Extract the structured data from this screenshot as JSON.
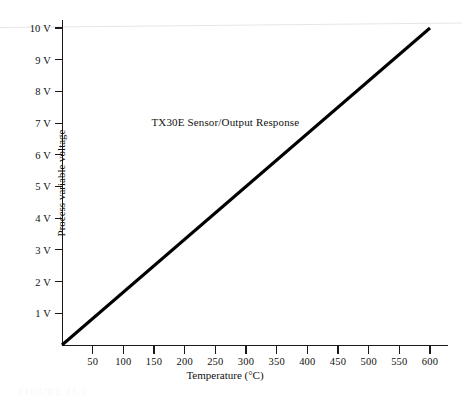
{
  "figure": {
    "annotation": "TX30E Sensor/Output Response",
    "caption_partial": "FIGURE 11-2"
  },
  "chart_data": {
    "type": "line",
    "title": "",
    "annotations": [
      {
        "text": "TX30E Sensor/Output Response",
        "x": 260,
        "y": 7.0
      }
    ],
    "xlabel": "Temperature (°C)",
    "ylabel": "Process variable voltage",
    "xlim": [
      0,
      645
    ],
    "ylim": [
      0,
      10.6
    ],
    "grid": false,
    "legend": null,
    "xticks": [
      50,
      100,
      150,
      200,
      250,
      300,
      350,
      400,
      450,
      500,
      550,
      600
    ],
    "xticklabels": [
      "50",
      "100",
      "150",
      "200",
      "250",
      "300",
      "350",
      "400",
      "450",
      "500",
      "550",
      "600"
    ],
    "yticks": [
      1,
      2,
      3,
      4,
      5,
      6,
      7,
      8,
      9,
      10
    ],
    "yticklabels": [
      "1 V",
      "2 V",
      "3 V",
      "4 V",
      "5 V",
      "6 V",
      "7 V",
      "8 V",
      "9 V",
      "10 V"
    ],
    "series": [
      {
        "name": "TX30E sensor output",
        "color": "#000000",
        "linewidth": 3,
        "x": [
          0,
          600
        ],
        "y": [
          0,
          10
        ]
      }
    ]
  }
}
